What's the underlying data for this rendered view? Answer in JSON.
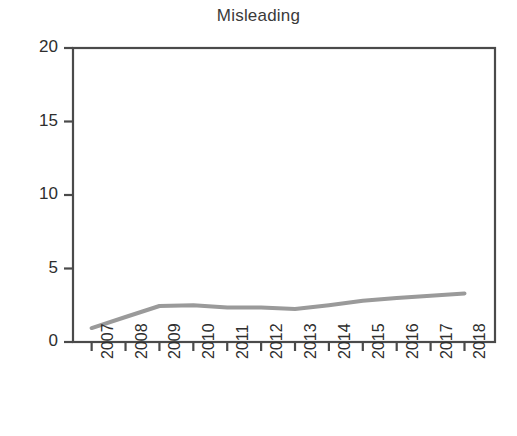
{
  "chart_data": {
    "type": "line",
    "title": "Misleading",
    "xlabel": "",
    "ylabel": "",
    "categories": [
      "2007",
      "2008",
      "2009",
      "2010",
      "2011",
      "2012",
      "2013",
      "2014",
      "2015",
      "2016",
      "2017",
      "2018"
    ],
    "values": [
      0.95,
      1.7,
      2.45,
      2.5,
      2.35,
      2.35,
      2.25,
      2.5,
      2.8,
      3.0,
      3.15,
      3.3
    ],
    "series": [
      {
        "name": "Misleading",
        "color": "#9a9a9a",
        "values": [
          0.95,
          1.7,
          2.45,
          2.5,
          2.35,
          2.35,
          2.25,
          2.5,
          2.8,
          3.0,
          3.15,
          3.3
        ]
      }
    ],
    "ylim": [
      0,
      20
    ],
    "yticks": [
      0,
      5,
      10,
      15,
      20
    ],
    "ytick_labels": [
      "0",
      "5",
      "10",
      "15",
      "20"
    ],
    "xtick_labels": [
      "2007",
      "2008",
      "2009",
      "2010",
      "2011",
      "2012",
      "2013",
      "2014",
      "2015",
      "2016",
      "2017",
      "2018"
    ],
    "xtick_rotation": 90,
    "grid": false,
    "legend": false,
    "legend_position": "none",
    "axis_box": true,
    "line_color": "#9a9a9a",
    "axis_color": "#4a4a4a",
    "background": "#ffffff"
  },
  "layout": {
    "plot_left": 73,
    "plot_right": 495,
    "plot_top": 48,
    "plot_bottom": 342,
    "width": 517,
    "height": 436
  }
}
